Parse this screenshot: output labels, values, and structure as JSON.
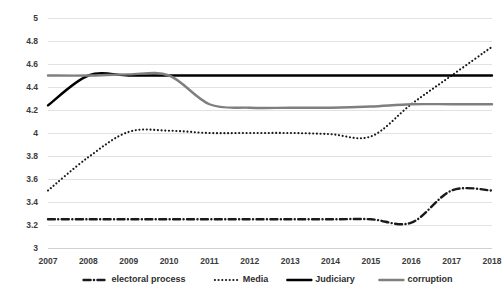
{
  "chart_data": {
    "type": "line",
    "title": "",
    "subtitle": "",
    "xlabel": "",
    "ylabel": "",
    "x": [
      2007,
      2008,
      2009,
      2010,
      2011,
      2012,
      2013,
      2014,
      2015,
      2016,
      2017,
      2018
    ],
    "categories": [
      "2007",
      "2008",
      "2009",
      "2010",
      "2011",
      "2012",
      "2013",
      "2014",
      "2015",
      "2016",
      "2017",
      "2018"
    ],
    "xlim": [
      2007,
      2018
    ],
    "ylim": [
      3,
      5
    ],
    "yticks": [
      3,
      3.2,
      3.4,
      3.6,
      3.8,
      4,
      4.2,
      4.4,
      4.6,
      4.8,
      5
    ],
    "ytick_labels": [
      "3",
      "3.2",
      "3.4",
      "3.6",
      "3.8",
      "4",
      "4.2",
      "4.4",
      "4.6",
      "4.8",
      "5"
    ],
    "grid": true,
    "grid_axis": "y",
    "smoothed": true,
    "legend_position": "bottom",
    "series": [
      {
        "name": "electoral process",
        "style": "dash-dot",
        "color": "#1a1a1a",
        "values": [
          3.25,
          3.25,
          3.25,
          3.25,
          3.25,
          3.25,
          3.25,
          3.25,
          3.25,
          3.22,
          3.5,
          3.5
        ]
      },
      {
        "name": "Media",
        "style": "dotted",
        "color": "#1a1a1a",
        "values": [
          3.5,
          3.79,
          4.01,
          4.02,
          4.0,
          4.0,
          4.0,
          3.99,
          3.97,
          4.25,
          4.5,
          4.75
        ]
      },
      {
        "name": "Judiciary",
        "style": "solid",
        "color": "#000000",
        "values": [
          4.24,
          4.5,
          4.5,
          4.5,
          4.5,
          4.5,
          4.5,
          4.5,
          4.5,
          4.5,
          4.5,
          4.5
        ]
      },
      {
        "name": "corruption",
        "style": "solid",
        "color": "#7f7f7f",
        "values": [
          4.5,
          4.5,
          4.51,
          4.5,
          4.25,
          4.22,
          4.22,
          4.22,
          4.23,
          4.25,
          4.25,
          4.25
        ]
      }
    ]
  },
  "legend": {
    "items": [
      {
        "label": "electoral process",
        "style": "dash-dot",
        "color": "#1a1a1a"
      },
      {
        "label": "Media",
        "style": "dotted",
        "color": "#1a1a1a"
      },
      {
        "label": "Judiciary",
        "style": "solid",
        "color": "#000000"
      },
      {
        "label": "corruption",
        "style": "solid",
        "color": "#7f7f7f"
      }
    ]
  }
}
